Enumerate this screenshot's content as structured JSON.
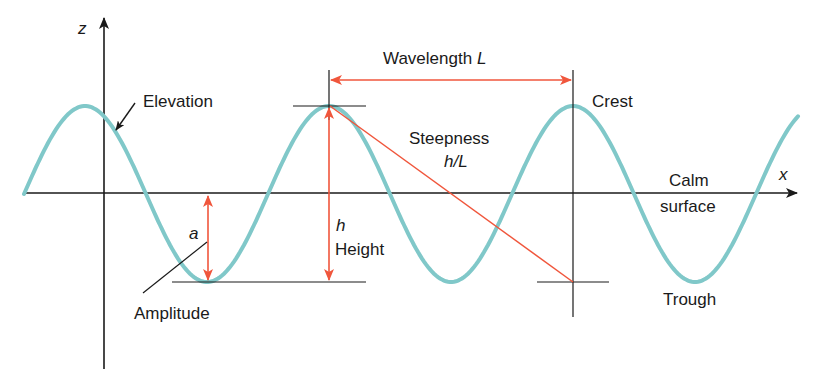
{
  "colors": {
    "wave": "#80c8c9",
    "measure": "#f0563c",
    "axis": "#1a1a1a",
    "background": "#ffffff"
  },
  "axes": {
    "z_label": "z",
    "x_label": "x"
  },
  "labels": {
    "elevation": "Elevation",
    "wavelength": "Wavelength ",
    "wavelength_symbol": "L",
    "crest": "Crest",
    "steepness": "Steepness",
    "steepness_formula": "h/L",
    "calm": "Calm",
    "surface": "surface",
    "amplitude_symbol": "a",
    "amplitude": "Amplitude",
    "height_symbol": "h",
    "height": "Height",
    "trough": "Trough"
  },
  "geometry": {
    "calm_y": 193,
    "crest_y": 106,
    "trough_y": 282,
    "wavelength_px": 244,
    "first_crest_x": 85,
    "wave_start_x": 24,
    "wave_end_x": 798
  }
}
